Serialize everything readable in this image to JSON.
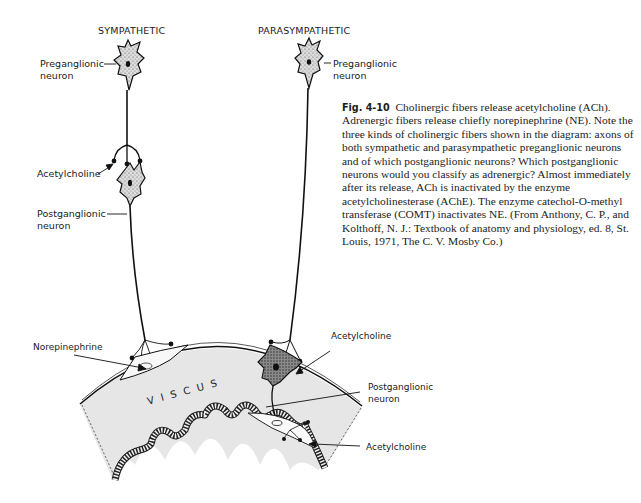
{
  "figure": {
    "headers": {
      "sympathetic": "SYMPATHETIC",
      "parasympathetic": "PARASYMPATHETIC"
    },
    "sympathetic_labels": {
      "preganglionic_line1": "Preganglionic",
      "preganglionic_line2": "neuron",
      "acetylcholine": "Acetylcholine",
      "postganglionic_line1": "Postganglionic",
      "postganglionic_line2": "neuron",
      "norepinephrine": "Norepinephrine"
    },
    "parasympathetic_labels": {
      "preganglionic_line1": "Preganglionic",
      "preganglionic_line2": "neuron",
      "acetylcholine_upper": "Acetylcholine",
      "postganglionic_line1": "Postganglionic",
      "postganglionic_line2": "neuron",
      "acetylcholine_lower": "Acetylcholine"
    },
    "organ_label": "VISCUS",
    "colors": {
      "viscus_fill": "#e6e6e6",
      "ink": "#111111",
      "neuron_fill": "#d9d9d9"
    }
  },
  "caption": {
    "figure_number": "Fig. 4-10",
    "text": "Cholinergic fibers release acetylcholine (ACh). Adrenergic fibers release chiefly norepinephrine (NE). Note the three kinds of cholinergic fibers shown in the diagram: axons of both sympathetic and parasympathetic preganglionic neurons and of which postganglionic neurons? Which postganglionic neurons would you classify as adrenergic? Almost immediately after its release, ACh is inactivated by the enzyme acetylcholinesterase (AChE). The enzyme catechol-O-methyl transferase (COMT) inactivates NE. (From Anthony, C. P., and Kolthoff, N. J.: Textbook of anatomy and physiology, ed. 8, St. Louis, 1971, The C. V. Mosby Co.)"
  }
}
